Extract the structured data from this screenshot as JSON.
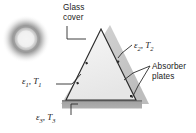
{
  "figure": {
    "name": "solar-collector-triangular-absorber-diagram",
    "background_color": "#ffffff",
    "labels": {
      "glass_cover_line1": "Glass",
      "glass_cover_line2": "cover",
      "absorber_line1": "Absorber",
      "absorber_line2": "plates",
      "emissivity_1": "ε",
      "emissivity_1_sub": "1",
      "temp_1": "T",
      "temp_1_sub": "1",
      "emissivity_2": "ε",
      "emissivity_2_sub": "2",
      "temp_2": "T",
      "temp_2_sub": "2",
      "emissivity_3": "ε",
      "emissivity_3_sub": "3",
      "temp_3": "T",
      "temp_3_sub": "3",
      "comma": ","
    },
    "colors": {
      "outline": "#2b2b2b",
      "glass_fill": "#c9c9c9",
      "inner_fill": "#eeeeee",
      "base_plate_fill": "#a6a6a6",
      "base_plate_top": "#8f8f8f",
      "leader_line": "#2b2b2b",
      "sun_ring": "#8c8c8c",
      "sun_core": "#f2f2f2"
    },
    "geometry": {
      "inner_triangle": "apex (101,29), left (66,100), right (136,100)",
      "glass_triangle": "apex (110,25), left (61,104), right (149,104)",
      "base_plate": "x 62 to 142, y 100 to 108",
      "sun_center": "(26,39)",
      "sun_radius": 20
    }
  }
}
